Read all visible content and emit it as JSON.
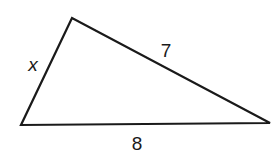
{
  "diagram": {
    "type": "triangle",
    "stroke_color": "#1a1a1a",
    "vertices": {
      "top": [
        72,
        18
      ],
      "bottom_left": [
        21,
        125
      ],
      "bottom_right": [
        270,
        123
      ]
    },
    "sides": {
      "left": {
        "label": "x"
      },
      "right": {
        "label": "7"
      },
      "bottom": {
        "label": "8"
      }
    }
  }
}
